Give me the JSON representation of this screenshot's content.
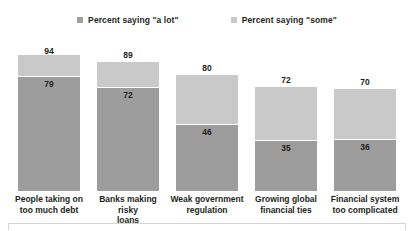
{
  "chart_data": {
    "type": "bar",
    "subtype": "stacked-bar",
    "title": "",
    "subtitle": "",
    "xlabel": "",
    "ylabel": "",
    "ylim": [
      0,
      100
    ],
    "grid": false,
    "legend_position": "top-center",
    "categories": [
      "People taking on too much debt",
      "Banks making risky loans",
      "Weak government regulation",
      "Growing global financial ties",
      "Financial system too complicated"
    ],
    "category_lines": [
      [
        "People taking on",
        "too much debt"
      ],
      [
        "Banks making risky",
        "loans"
      ],
      [
        "Weak government",
        "regulation"
      ],
      [
        "Growing global",
        "financial ties"
      ],
      [
        "Financial system",
        "too complicated"
      ]
    ],
    "series": [
      {
        "name": "Percent saying \"a lot\"",
        "color": "#9d9d9d",
        "values": [
          79,
          72,
          46,
          35,
          36
        ]
      },
      {
        "name": "Percent saying \"some\"",
        "color": "#c9c9c9",
        "values": [
          15,
          17,
          34,
          37,
          34
        ]
      }
    ],
    "totals": [
      94,
      89,
      80,
      72,
      70
    ],
    "total_labels": [
      "94",
      "89",
      "80",
      "72",
      "70"
    ],
    "alot_labels": [
      "79",
      "72",
      "46",
      "35",
      "36"
    ]
  },
  "legend": {
    "items": [
      {
        "label": "Percent saying \"a lot\"",
        "color": "#9d9d9d"
      },
      {
        "label": "Percent saying \"some\"",
        "color": "#c9c9c9"
      }
    ]
  }
}
